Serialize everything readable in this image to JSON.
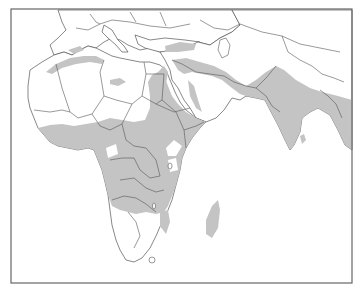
{
  "map": {
    "title": "",
    "region": "Africa, Southern Europe, Middle East and South Asia",
    "legend": [],
    "colors": {
      "background": "#ffffff",
      "land": "#ffffff",
      "distribution_range": "#c4c4c4",
      "borders": "#555555",
      "frame": "#666666"
    },
    "shaded_regions": [
      "Sub-Saharan Africa (West, Central, East)",
      "Northern Angola, Zambia, Mozambique, Zimbabwe north",
      "Madagascar margin",
      "Atlas coast of Morocco / Algeria / Tunisia",
      "Nile valley",
      "Southern Turkey",
      "Arabian Peninsula western & southern margins",
      "Iran / Iraq / Zagros belt",
      "Pakistan",
      "India",
      "Bangladesh / Myanmar",
      "Sri Lanka"
    ]
  }
}
